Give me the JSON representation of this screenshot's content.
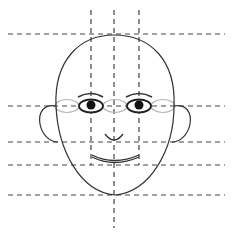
{
  "diagram": {
    "type": "face-proportion-guide",
    "colors": {
      "background": "#ffffff",
      "outline": "#333333",
      "guides": "#444444",
      "guide_ovals": "#b5b5b5",
      "pupil": "#111111"
    },
    "guides": {
      "horizontal_y": [
        34,
        106,
        142,
        165,
        195
      ],
      "vertical_x": [
        91,
        114,
        139
      ],
      "horizontal_labels": [
        "top-of-head",
        "eye-line",
        "nose-base",
        "mouth-line",
        "chin-line"
      ],
      "vertical_labels": [
        "left-eye-center",
        "center-line",
        "right-eye-center"
      ]
    },
    "features": [
      "head",
      "left-ear",
      "right-ear",
      "left-eyebrow",
      "right-eyebrow",
      "left-eye",
      "right-eye",
      "nose",
      "mouth",
      "eye-width-ovals"
    ]
  }
}
